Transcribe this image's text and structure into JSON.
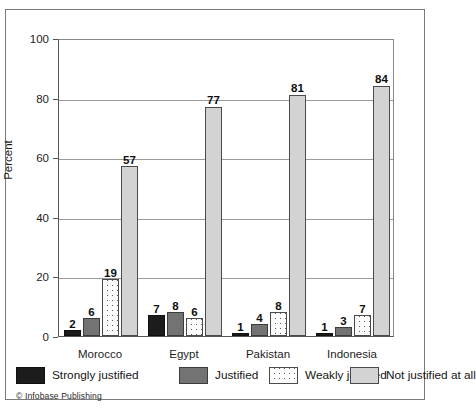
{
  "chart_data": {
    "type": "bar",
    "title": "",
    "xlabel": "",
    "ylabel": "Percent",
    "ylim": [
      0,
      100
    ],
    "yticks": [
      0,
      20,
      40,
      60,
      80,
      100
    ],
    "grid": true,
    "legend_position": "bottom",
    "categories": [
      "Morocco",
      "Egypt",
      "Pakistan",
      "Indonesia"
    ],
    "series": [
      {
        "name": "Strongly justified",
        "values": [
          2,
          7,
          1,
          1
        ],
        "color": "#1c1c1c"
      },
      {
        "name": "Justified",
        "values": [
          6,
          8,
          4,
          3
        ],
        "color": "#737373"
      },
      {
        "name": "Weakly justified",
        "values": [
          19,
          6,
          8,
          7
        ],
        "color": "#fbfbfb"
      },
      {
        "name": "Not justified at all",
        "values": [
          57,
          77,
          81,
          84
        ],
        "color": "#d3d3d3"
      }
    ]
  },
  "axis": {
    "ylabel": "Percent",
    "ytick_labels": [
      "100",
      "80",
      "60",
      "40",
      "20",
      "0"
    ]
  },
  "legend": {
    "items": [
      {
        "label": "Strongly justified"
      },
      {
        "label": "Justified"
      },
      {
        "label": "Weakly justified"
      },
      {
        "label": "Not justified at all"
      }
    ]
  },
  "credit": "© Infobase Publishing"
}
